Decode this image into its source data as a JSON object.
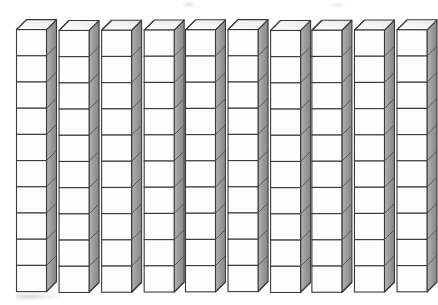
{
  "illustration": {
    "title": "Base-ten blocks: ten rods of ten unit cubes",
    "subject": "base-ten-blocks",
    "projection": "oblique-isometric",
    "background_color": "#ffffff"
  },
  "manipulative": {
    "name": "base-ten rods",
    "rod_count": 10,
    "cubes_per_rod": 10,
    "total_unit_cubes": 100,
    "represents_value": 100,
    "rod_value": 10,
    "unit_value": 1,
    "arrangement": "row of vertical rods, evenly spaced, left to right"
  },
  "geometry": {
    "first_rod_left_x": 17,
    "rod_pitch_x": 42.2,
    "front_face_width": 30,
    "cube_front_height": 26.2,
    "stack_top_y": 30,
    "depth_dx": 10,
    "depth_dy": -10,
    "canvas_width": 438,
    "canvas_height": 305
  },
  "colors": {
    "front_face": "#fdfdfd",
    "top_face": "#f2f2f2",
    "side_face": "#9c9c9c",
    "side_face_dark": "#8a8a8a",
    "outline": "#3a3a3a",
    "inner_line": "#585858",
    "background": "#ffffff",
    "smudge": "#a0a0a0"
  },
  "labels": {
    "caption": ""
  },
  "chart_data": {
    "type": "bar",
    "categories": [
      "Rod 1",
      "Rod 2",
      "Rod 3",
      "Rod 4",
      "Rod 5",
      "Rod 6",
      "Rod 7",
      "Rod 8",
      "Rod 9",
      "Rod 10"
    ],
    "values": [
      10,
      10,
      10,
      10,
      10,
      10,
      10,
      10,
      10,
      10
    ],
    "xlabel": "",
    "ylabel": "Unit cubes",
    "ylim": [
      0,
      10
    ],
    "grid": false,
    "legend": "none"
  }
}
